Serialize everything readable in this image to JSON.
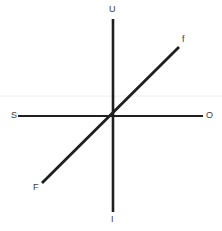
{
  "diagram": {
    "type": "axis-cross",
    "background_color": "#ffffff",
    "line_color": "#1f1f1f",
    "label_color": "#3a3a3a",
    "faint_line_color": "#f2f0f0",
    "canvas": {
      "width": 222,
      "height": 231
    },
    "origin": {
      "x": 113,
      "y": 116
    },
    "axes": [
      {
        "name": "vertical-axis",
        "positive_label": "U",
        "negative_label": "I",
        "x1": 113,
        "y1": 19,
        "x2": 113,
        "y2": 212,
        "stroke_width": 2.6
      },
      {
        "name": "horizontal-axis",
        "positive_label": "O",
        "negative_label": "S",
        "x1": 18,
        "y1": 116,
        "x2": 203,
        "y2": 116,
        "stroke_width": 2.2
      },
      {
        "name": "diagonal-axis",
        "positive_label": "f",
        "negative_label": "F",
        "x1": 42,
        "y1": 183,
        "x2": 179,
        "y2": 47,
        "stroke_width": 2.8
      }
    ],
    "faint_guide_line": {
      "name": "faint-horizontal-guide",
      "x1": 0,
      "y1": 96,
      "x2": 222,
      "y2": 96,
      "stroke_width": 1
    },
    "labels": {
      "up": "U",
      "down": "I",
      "left": "S",
      "right": "O",
      "diagonal_up": "f",
      "diagonal_down": "F"
    }
  }
}
